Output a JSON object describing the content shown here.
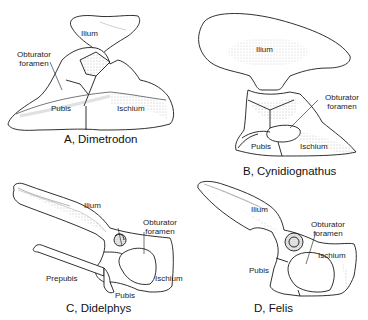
{
  "figure": {
    "panels": [
      {
        "id": "A",
        "caption": "A, Dimetrodon",
        "labels": {
          "ilium": "Ilium",
          "obturator_1": "Obturator",
          "obturator_2": "foramen",
          "pubis": "Pubis",
          "ischium": "Ischium"
        }
      },
      {
        "id": "B",
        "caption": "B,  Cynidiognathus",
        "labels": {
          "ilium": "Ilium",
          "obturator_1": "Obturator",
          "obturator_2": "foramen",
          "pubis": "Pubis",
          "ischium": "Ischium"
        }
      },
      {
        "id": "C",
        "caption": "C, Didelphys",
        "labels": {
          "ilium": "Ilium",
          "obturator_1": "Obturator",
          "obturator_2": "foramen",
          "prepubis": "Prepubis",
          "pubis": "Pubis",
          "ischium": "Ischium"
        }
      },
      {
        "id": "D",
        "caption": "D, Felis",
        "labels": {
          "ilium": "Ilium",
          "obturator_1": "Obturator",
          "obturator_2": "foramen",
          "pubis": "Pubis",
          "ischium": "Ischium"
        }
      }
    ],
    "colors": {
      "ink": "#1a1a1a",
      "stipple": "#9a9a9a",
      "background": "#ffffff"
    }
  }
}
